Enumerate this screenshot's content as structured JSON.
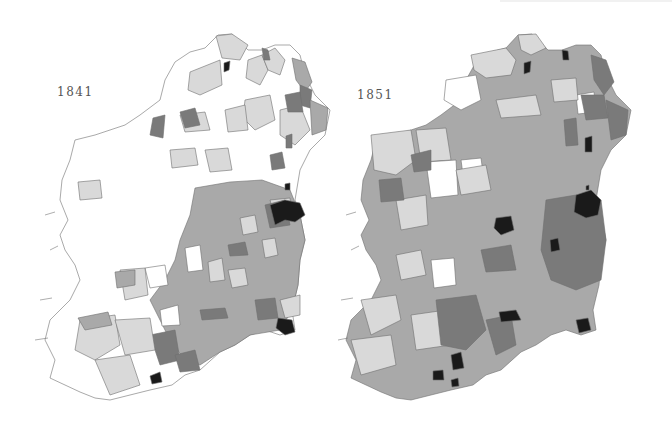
{
  "figure": {
    "type": "choropleth-map-pair",
    "shade_levels": {
      "level0": "#ffffff",
      "level1": "#d9d9d9",
      "level2": "#a9a9a9",
      "level3": "#7a7a7a",
      "level4": "#1a1a1a"
    }
  },
  "maps": [
    {
      "year_label": "1841",
      "label_position": {
        "x": 57,
        "y": 92
      },
      "dominant_shade": "level0",
      "notes": "West and northwest mostly white; east and south mid-grey; Dublin, Cork city and Wexford coast darkest"
    },
    {
      "year_label": "1851",
      "label_position": {
        "x": 357,
        "y": 95
      },
      "dominant_shade": "level2",
      "notes": "Most districts shaded grey; west light grey; Dublin, Cork, Waterford, Wexford and several inland towns black"
    }
  ]
}
